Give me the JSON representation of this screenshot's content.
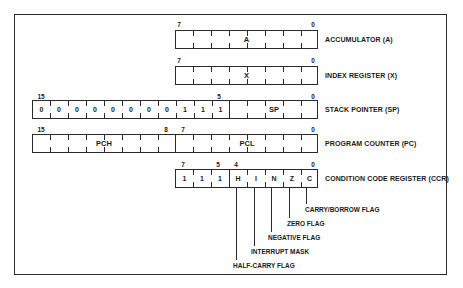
{
  "registers": [
    {
      "id": "accumulator",
      "label": "ACCUMULATOR (A)",
      "field": "A",
      "bit_labels": {
        "msb": "7",
        "lsb": "0"
      }
    },
    {
      "id": "index",
      "label": "INDEX REGISTER (X)",
      "field": "X",
      "bit_labels": {
        "msb": "7",
        "lsb": "0"
      }
    },
    {
      "id": "stack_pointer",
      "label": "STACK POINTER (SP)",
      "field": "SP",
      "fixed_bits": [
        "0",
        "0",
        "0",
        "0",
        "0",
        "0",
        "0",
        "0",
        "1",
        "1",
        "1"
      ],
      "bit_labels": {
        "msb": "15",
        "mid": "5",
        "lsb": "0"
      }
    },
    {
      "id": "program_counter",
      "label": "PROGRAM COUNTER (PC)",
      "high_field": "PCH",
      "low_field": "PCL",
      "bit_labels": {
        "msb": "15",
        "high_lsb": "8",
        "low_msb": "7",
        "lsb": "0"
      }
    },
    {
      "id": "ccr",
      "label": "CONDITION CODE REGISTER (CCR)",
      "cells": [
        "1",
        "1",
        "1",
        "H",
        "I",
        "N",
        "Z",
        "C"
      ],
      "bit_labels": {
        "msb": "7",
        "b5": "5",
        "b4": "4",
        "lsb": "0"
      }
    }
  ],
  "flags": [
    {
      "bit": "C",
      "label": "CARRY/BORROW FLAG"
    },
    {
      "bit": "Z",
      "label": "ZERO FLAG"
    },
    {
      "bit": "N",
      "label": "NEGATIVE FLAG"
    },
    {
      "bit": "I",
      "label": "INTERRUPT MASK"
    },
    {
      "bit": "H",
      "label": "HALF-CARRY FLAG"
    }
  ]
}
